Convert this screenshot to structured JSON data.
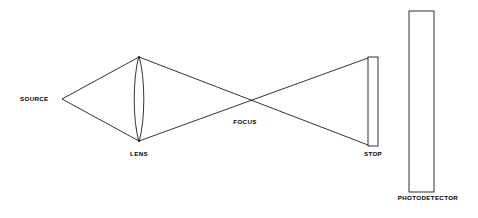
{
  "diagram": {
    "background_color": "#ffffff",
    "stroke_color": "#000000",
    "text_color": "#000000",
    "canvas": {
      "width": 478,
      "height": 218
    }
  },
  "labels": {
    "source": "SOURCE",
    "lens": "LENS",
    "focus": "FOCUS",
    "stop": "STOP",
    "photodetector": "PHOTODETECTOR"
  },
  "components": {
    "source": {
      "name": "SOURCE",
      "kind": "point-source",
      "point": {
        "x": 62,
        "y": 99
      }
    },
    "lens": {
      "name": "LENS",
      "kind": "biconvex-lens",
      "center_x": 139,
      "top_y": 56,
      "bottom_y": 142,
      "half_width": 6
    },
    "focus": {
      "name": "FOCUS",
      "kind": "crossing-point",
      "point": {
        "x": 248,
        "y": 99
      }
    },
    "stop": {
      "name": "STOP",
      "kind": "aperture-plate",
      "rect": {
        "x": 368,
        "y": 57,
        "width": 10,
        "height": 89
      }
    },
    "photodetector": {
      "name": "PHOTODETECTOR",
      "kind": "detector-plate",
      "rect": {
        "x": 409,
        "y": 11,
        "width": 25,
        "height": 181
      }
    }
  },
  "rays": {
    "source_to_lens": [
      {
        "from": {
          "x": 62,
          "y": 99
        },
        "to": {
          "x": 139,
          "y": 57
        }
      },
      {
        "from": {
          "x": 62,
          "y": 99
        },
        "to": {
          "x": 139,
          "y": 141
        }
      }
    ],
    "lens_to_stop": [
      {
        "from": {
          "x": 139,
          "y": 57
        },
        "to": {
          "x": 368,
          "y": 145
        }
      },
      {
        "from": {
          "x": 139,
          "y": 141
        },
        "to": {
          "x": 368,
          "y": 58
        }
      }
    ]
  }
}
